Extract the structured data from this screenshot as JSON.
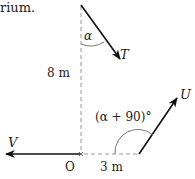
{
  "diagram": {
    "caption_fragment": "rium.",
    "vectors": {
      "T": {
        "label": "T",
        "direction": "down-right from top of vertical line"
      },
      "V": {
        "label": "V",
        "direction": "left along horizontal from O"
      },
      "U": {
        "label": "U",
        "direction": "up-right from point 3 m right of O"
      }
    },
    "angles": {
      "alpha": "α",
      "u_angle": "(α + 90)°"
    },
    "dimensions": {
      "vertical": "8 m",
      "horizontal": "3 m"
    },
    "origin_label": "O",
    "colors": {
      "arrow": "#111111",
      "dashed": "#999999",
      "arc": "#777777",
      "text": "#222222"
    }
  }
}
